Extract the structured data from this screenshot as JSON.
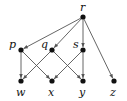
{
  "diagram": {
    "type": "directed-graph",
    "nodes": [
      {
        "id": "r",
        "label": "r",
        "x": 83,
        "y": 17,
        "lx": 80,
        "ly": 11
      },
      {
        "id": "p",
        "label": "p",
        "x": 21,
        "y": 50,
        "lx": 9,
        "ly": 48
      },
      {
        "id": "q",
        "label": "q",
        "x": 52,
        "y": 50,
        "lx": 41,
        "ly": 48
      },
      {
        "id": "s",
        "label": "s",
        "x": 83,
        "y": 50,
        "lx": 73,
        "ly": 48
      },
      {
        "id": "w",
        "label": "w",
        "x": 21,
        "y": 81,
        "lx": 16,
        "ly": 96
      },
      {
        "id": "x",
        "label": "x",
        "x": 52,
        "y": 81,
        "lx": 48,
        "ly": 96
      },
      {
        "id": "y",
        "label": "y",
        "x": 83,
        "y": 81,
        "lx": 79,
        "ly": 96
      },
      {
        "id": "z",
        "label": "z",
        "x": 114,
        "y": 81,
        "lx": 110,
        "ly": 96
      }
    ],
    "edges": [
      {
        "from": "r",
        "to": "p"
      },
      {
        "from": "r",
        "to": "q"
      },
      {
        "from": "r",
        "to": "s"
      },
      {
        "from": "r",
        "to": "z"
      },
      {
        "from": "p",
        "to": "w"
      },
      {
        "from": "p",
        "to": "x"
      },
      {
        "from": "q",
        "to": "w"
      },
      {
        "from": "q",
        "to": "y"
      },
      {
        "from": "s",
        "to": "x"
      },
      {
        "from": "s",
        "to": "y"
      }
    ]
  }
}
